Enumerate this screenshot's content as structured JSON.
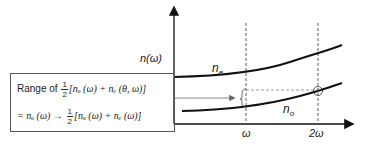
{
  "diagram": {
    "y_axis_label": "n(ω)",
    "x_ticks": [
      "ω",
      "2ω"
    ],
    "curves": [
      {
        "name": "n_e",
        "label": "n",
        "sub": "e"
      },
      {
        "name": "n_o",
        "label": "n",
        "sub": "o"
      }
    ],
    "box": {
      "line1_prefix": "Range of",
      "line1_frac_num": "1",
      "line1_frac_den": "2",
      "line1_expr": "[nₒ (ω) + nₑ (θ, ω)]",
      "line2_prefix": "= nₒ (ω) →",
      "line2_frac_num": "1",
      "line2_frac_den": "2",
      "line2_expr": "[nₒ (ω) + nₑ (ω)]"
    }
  }
}
